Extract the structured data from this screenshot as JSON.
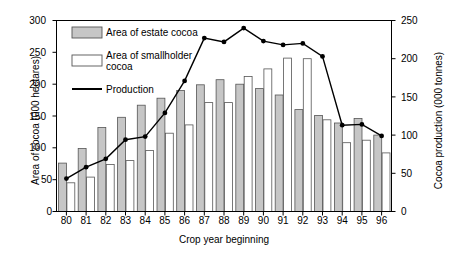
{
  "chart_data": {
    "type": "bar",
    "title": "",
    "subtitle": "",
    "xlabel": "Crop year beginning",
    "ylabel": "Area of cocoa (000 hectares)",
    "ylabel_secondary": "Cocoa production (000 tonnes)",
    "categories": [
      "80",
      "81",
      "82",
      "83",
      "84",
      "85",
      "86",
      "87",
      "88",
      "89",
      "90",
      "91",
      "92",
      "93",
      "94",
      "95",
      "96"
    ],
    "ylim": [
      0,
      300
    ],
    "yticks": [
      0,
      50,
      100,
      150,
      200,
      250,
      300
    ],
    "ylim_secondary": [
      0,
      250
    ],
    "yticks_secondary": [
      0,
      50,
      100,
      150,
      200,
      250
    ],
    "grid": false,
    "legend_position": "upper-left-inside",
    "series": [
      {
        "name": "Area of estate cocoa",
        "type": "bar",
        "axis": "left",
        "color": "#c6c6c6",
        "values": [
          76,
          99,
          132,
          148,
          167,
          178,
          190,
          199,
          207,
          200,
          193,
          183,
          160,
          151,
          139,
          146,
          120
        ]
      },
      {
        "name": "Area of smallholder cocoa",
        "type": "bar",
        "axis": "left",
        "color": "#ffffff",
        "values": [
          45,
          54,
          74,
          80,
          96,
          123,
          136,
          171,
          171,
          212,
          224,
          241,
          240,
          144,
          108,
          112,
          92
        ]
      },
      {
        "name": "Production",
        "type": "line",
        "axis": "right",
        "color": "#000000",
        "values": [
          43,
          58,
          69,
          94,
          98,
          129,
          171,
          227,
          222,
          240,
          223,
          218,
          220,
          203,
          113,
          114,
          99
        ]
      }
    ],
    "legend": [
      {
        "label": "Area of estate cocoa",
        "marker": "filled-swatch"
      },
      {
        "label": "Area of smallholder\ncocoa",
        "marker": "open-swatch"
      },
      {
        "label": "Production",
        "marker": "line"
      }
    ]
  },
  "axes": {
    "left_ticks": [
      "0",
      "50",
      "100",
      "150",
      "200",
      "250",
      "300"
    ],
    "right_ticks": [
      "0",
      "50",
      "100",
      "150",
      "200",
      "250"
    ],
    "x_ticks": [
      "80",
      "81",
      "82",
      "83",
      "84",
      "85",
      "86",
      "87",
      "88",
      "89",
      "90",
      "91",
      "92",
      "93",
      "94",
      "95",
      "96"
    ]
  },
  "colors": {
    "estate_fill": "#c6c6c6",
    "smallholder_fill": "#ffffff",
    "bar_stroke": "#555555",
    "line": "#000000",
    "axis": "#000000",
    "background": "#ffffff"
  }
}
